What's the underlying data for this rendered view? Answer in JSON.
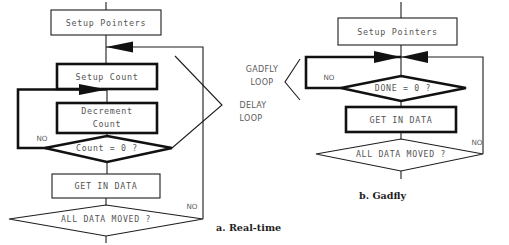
{
  "figure": {
    "background": "#ffffff",
    "line_color": "#1d1d1d",
    "text_color": "#555555",
    "caption_color": "#1d1d1d"
  },
  "middle_labels": {
    "gadfly_loop_line1": "GADFLY",
    "gadfly_loop_line2": "LOOP",
    "delay_loop_line1": "DELAY",
    "delay_loop_line2": "LOOP"
  },
  "left_chart": {
    "caption": "a. Real-time",
    "nodes": {
      "setup_pointers": "Setup Pointers",
      "setup_count": "Setup Count",
      "decrement_count_line1": "Decrement",
      "decrement_count_line2": "Count",
      "count_zero": "Count = 0 ?",
      "get_in_data": "GET IN DATA",
      "all_data_moved": "ALL DATA MOVED ?"
    },
    "edge_labels": {
      "count_no": "NO",
      "all_data_no": "NO"
    }
  },
  "right_chart": {
    "caption": "b. Gadfly",
    "nodes": {
      "setup_pointers": "Setup Pointers",
      "done_zero": "DONE = 0 ?",
      "get_in_data": "GET IN DATA",
      "all_data_moved": "ALL DATA MOVED ?"
    },
    "edge_labels": {
      "done_no": "NO",
      "all_data_no": "NO"
    }
  }
}
